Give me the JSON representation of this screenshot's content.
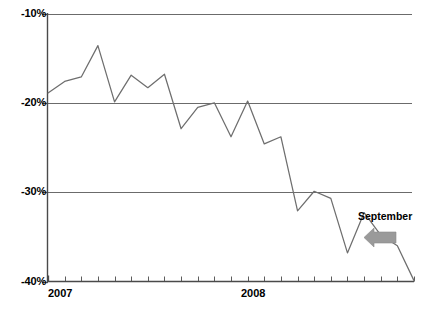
{
  "chart_data": {
    "type": "line",
    "title": "",
    "subtitle": "",
    "xlabel": "",
    "ylabel": "",
    "ylim": [
      -40,
      -10
    ],
    "xlim": [
      0,
      22
    ],
    "grid": true,
    "gridlines": [
      -10,
      -20,
      -30
    ],
    "legend": null,
    "legend_position": "none",
    "yticks": [
      -10,
      -20,
      -30,
      -40
    ],
    "ytick_labels": [
      "-10%",
      "-20%",
      "-30%",
      "-40%"
    ],
    "xtick_count": 23,
    "xtick_labels": [
      "2007",
      "2008"
    ],
    "xtick_label_positions": [
      0,
      12
    ],
    "series": [
      {
        "name": "value",
        "color": "#6e6e6e",
        "x": [
          0,
          1,
          2,
          3,
          4,
          5,
          6,
          7,
          8,
          9,
          10,
          11,
          12,
          13,
          14,
          15,
          16,
          17,
          18,
          19,
          20,
          21,
          22
        ],
        "values": [
          -18.9,
          -17.6,
          -17.1,
          -13.6,
          -19.9,
          -16.9,
          -18.3,
          -16.8,
          -22.9,
          -20.5,
          -20.0,
          -23.8,
          -19.8,
          -24.6,
          -23.8,
          -32.1,
          -29.9,
          -30.7,
          -36.8,
          -32.3,
          -34.8,
          -36.0,
          -39.9
        ]
      }
    ],
    "annotations": [
      {
        "name": "september-callout",
        "label": "September",
        "arrow": "left-arrow",
        "arrow_color": "#9a9a9a",
        "target_x": 19,
        "target_y": -32.3
      }
    ]
  },
  "axis": {
    "y_labels": [
      "-10%",
      "-20%",
      "-30%",
      "-40%"
    ],
    "x_labels": [
      "2007",
      "2008"
    ]
  },
  "annotation": {
    "september_label": "September"
  },
  "footer": {
    "source_note": ""
  },
  "colors": {
    "line": "#6e6e6e",
    "grid": "#6b6b6b",
    "axis": "#4a4a4a",
    "arrow": "#9a9a9a",
    "text": "#000000",
    "background": "#ffffff"
  }
}
